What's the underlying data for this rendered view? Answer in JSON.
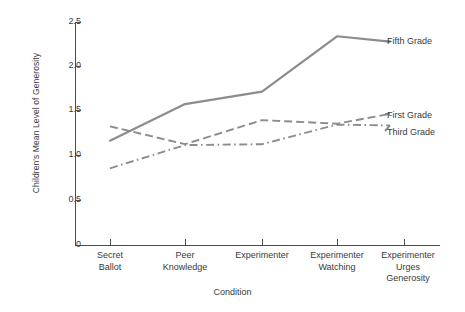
{
  "chart_data": {
    "type": "line",
    "title": "",
    "xlabel": "Condition",
    "ylabel": "Children's Mean Level of Generosity",
    "categories": [
      "Secret Ballot",
      "Peer Knowledge",
      "Experimenter",
      "Experimenter Watching",
      "Experimenter Urges Generosity"
    ],
    "category_lines": [
      [
        "Secret",
        "Ballot"
      ],
      [
        "Peer",
        "Knowledge"
      ],
      [
        "Experimenter"
      ],
      [
        "Experimenter",
        "Watching"
      ],
      [
        "Experimenter",
        "Urges",
        "Generosity"
      ]
    ],
    "ylim": [
      0,
      2.5
    ],
    "yticks": [
      0,
      0.5,
      1.0,
      1.5,
      2.0,
      2.5
    ],
    "ytick_labels": [
      "0",
      "0.5",
      "1.0",
      "1.5",
      "2.0",
      "2.5"
    ],
    "grid": false,
    "legend_position": "right-inline",
    "series": [
      {
        "name": "Fifth Grade",
        "style": "solid",
        "color": "#8c8c8c",
        "values": [
          1.17,
          1.58,
          1.72,
          2.34,
          2.28
        ]
      },
      {
        "name": "First Grade",
        "style": "dashed",
        "color": "#8c8c8c",
        "values": [
          1.33,
          1.13,
          1.4,
          1.36,
          1.47
        ]
      },
      {
        "name": "Third Grade",
        "style": "dash-dot",
        "color": "#8c8c8c",
        "values": [
          0.86,
          1.12,
          1.13,
          1.35,
          1.34
        ]
      }
    ]
  },
  "axes": {
    "y_title": "Children's Mean Level of Generosity",
    "x_title": "Condition"
  },
  "ylabels": {
    "t0": "0",
    "t1": "0.5",
    "t2": "1.0",
    "t3": "1.5",
    "t4": "2.0",
    "t5": "2.5"
  },
  "xlabels": {
    "c0l0": "Secret",
    "c0l1": "Ballot",
    "c1l0": "Peer",
    "c1l1": "Knowledge",
    "c2l0": "Experimenter",
    "c3l0": "Experimenter",
    "c3l1": "Watching",
    "c4l0": "Experimenter",
    "c4l1": "Urges",
    "c4l2": "Generosity"
  },
  "legend": {
    "fifth": "Fifth Grade",
    "first": "First Grade",
    "third": "Third Grade"
  }
}
